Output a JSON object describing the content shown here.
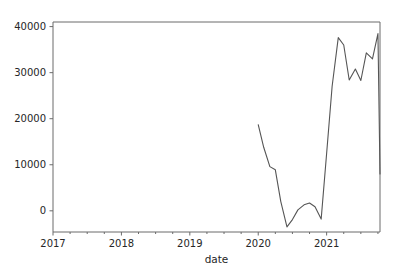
{
  "figure": {
    "background_color": "#ffffff",
    "plot_area": {
      "left": 53,
      "top": 22,
      "right": 380,
      "bottom": 232
    },
    "axis_color": "#6b6b6b",
    "text_color": "#262626"
  },
  "chart_data": {
    "type": "line",
    "title": "",
    "xlabel": "date",
    "ylabel": "",
    "xlim": [
      2017.0,
      2021.78
    ],
    "ylim": [
      -4600,
      41000
    ],
    "xticks": [
      2017,
      2018,
      2019,
      2020,
      2021
    ],
    "xtick_labels": [
      "2017",
      "2018",
      "2019",
      "2020",
      "2021"
    ],
    "yticks": [
      0,
      10000,
      20000,
      30000,
      40000
    ],
    "ytick_labels": [
      "0",
      "10000",
      "20000",
      "30000",
      "40000"
    ],
    "xminor_ticks": [
      2017.25,
      2017.5,
      2017.75,
      2018.25,
      2018.5,
      2018.75,
      2019.25,
      2019.5,
      2019.75,
      2020.25,
      2020.5,
      2020.75,
      2021.25,
      2021.5,
      2021.75
    ],
    "grid": false,
    "legend": false,
    "line_color": "#555555",
    "line_width": 1.1,
    "series": [
      {
        "name": "value",
        "x": [
          2020.0,
          2020.08,
          2020.17,
          2020.25,
          2020.33,
          2020.42,
          2020.5,
          2020.58,
          2020.67,
          2020.75,
          2020.83,
          2020.92,
          2021.0,
          2021.08,
          2021.17,
          2021.25,
          2021.33,
          2021.42,
          2021.5,
          2021.58,
          2021.67,
          2021.75
        ],
        "y": [
          18700,
          13800,
          9600,
          8900,
          2000,
          -3500,
          -1900,
          200,
          1300,
          1700,
          900,
          -1800,
          12500,
          27000,
          37600,
          36000,
          28400,
          30800,
          28300,
          34300,
          33000,
          38500
        ],
        "y_final": 8000
      }
    ]
  },
  "annotations": {
    "x_axis_label": "date"
  }
}
